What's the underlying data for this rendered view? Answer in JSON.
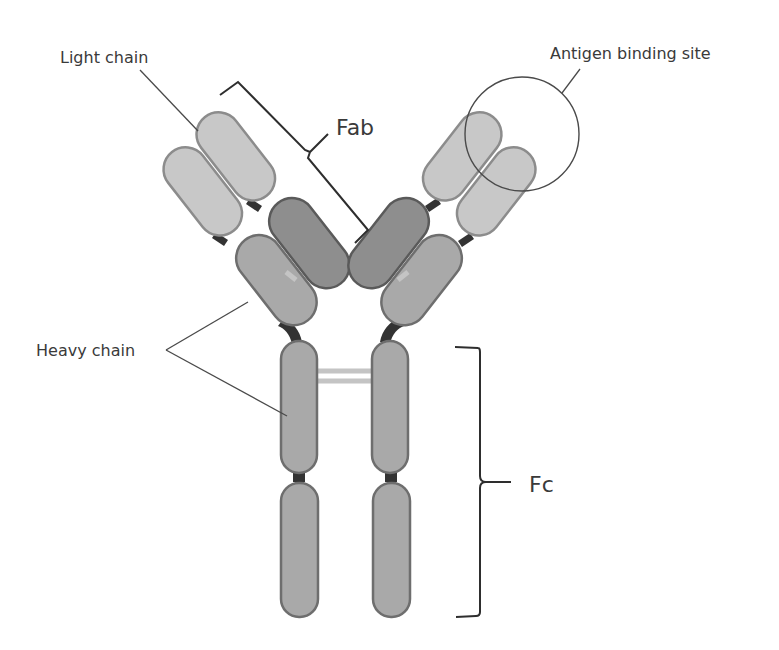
{
  "diagram": {
    "labels": {
      "light_chain": "Light chain",
      "heavy_chain": "Heavy chain",
      "antigen_binding_site": "Antigen binding site",
      "fab": "Fab",
      "fc": "Fc"
    },
    "colors": {
      "light_chain_fill": "#c8c8c8",
      "heavy_chain_fill": "#a9a9a9",
      "heavy_variable_fill": "#8e8e8e",
      "hinge": "#333333",
      "disulfide_bond": "#c4c4c4",
      "text": "#3a3a3a"
    },
    "components": [
      "light chain (x2)",
      "heavy chain (x2)",
      "antigen binding site (circled)",
      "Fab region (bracketed)",
      "Fc region (bracketed)",
      "disulfide bonds between heavy chains"
    ]
  }
}
